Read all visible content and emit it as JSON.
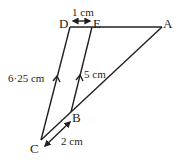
{
  "diagram": {
    "type": "geometry-triangle-parallel-lines",
    "colors": {
      "stroke": "#231f20",
      "background": "#ffffff"
    },
    "points": {
      "D": {
        "label": "D",
        "x": 70,
        "y": 27
      },
      "E": {
        "label": "E",
        "x": 92,
        "y": 27
      },
      "A": {
        "label": "A",
        "x": 162,
        "y": 27
      },
      "C": {
        "label": "C",
        "x": 41,
        "y": 140
      },
      "B": {
        "label": "B",
        "x": 71,
        "y": 112
      }
    },
    "segments": [
      {
        "from": "D",
        "to": "A"
      },
      {
        "from": "D",
        "to": "C"
      },
      {
        "from": "E",
        "to": "B"
      },
      {
        "from": "C",
        "to": "A"
      }
    ],
    "measurements": {
      "DE": "1 cm",
      "DC": "6·25 cm",
      "EB": "5 cm",
      "CB": "2 cm"
    },
    "parallel_marks": [
      "DC",
      "EB"
    ]
  }
}
